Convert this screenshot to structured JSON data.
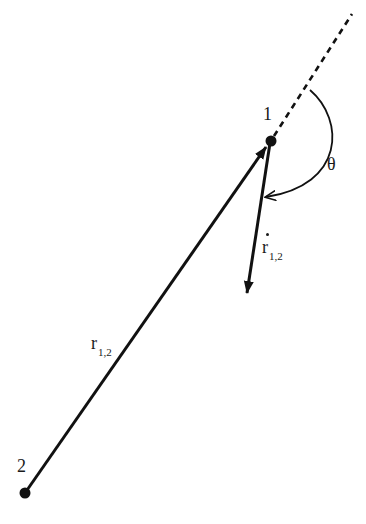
{
  "diagram": {
    "type": "vector-diagram",
    "points": [
      {
        "id": "1",
        "label": "1",
        "x": 271,
        "y": 141
      },
      {
        "id": "2",
        "label": "2",
        "x": 25,
        "y": 493
      }
    ],
    "vectors": [
      {
        "name": "r_1,2",
        "from": "2",
        "to": "1",
        "style": "solid-arrow",
        "label_main": "r",
        "label_sub": "1,2"
      },
      {
        "name": "r_dot_1,2",
        "from": "1",
        "to_xy": [
          246,
          295
        ],
        "style": "solid-arrow",
        "label_main": "r",
        "label_sub": "1,2",
        "label_accent": "dot"
      }
    ],
    "extension_line": {
      "style": "dashed",
      "from": "1",
      "to_xy": [
        352,
        14
      ]
    },
    "angle": {
      "label": "θ",
      "between": [
        "extension_line",
        "r_dot_1,2"
      ],
      "style": "arc-arrow"
    },
    "colors": {
      "ink": "#111111",
      "background": "#ffffff"
    }
  }
}
